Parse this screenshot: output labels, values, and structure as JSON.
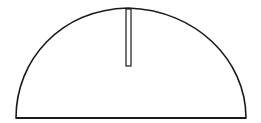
{
  "diagram": {
    "stroke_color": "#1a1a1a",
    "background": "#ffffff",
    "shapes": {
      "semicircle": {
        "left_x": 16,
        "right_x": 246,
        "base_y": 118,
        "apex_x": 128,
        "apex_y": 8
      },
      "slot": {
        "x": 126,
        "y": 9,
        "width": 5,
        "height": 57
      }
    }
  }
}
